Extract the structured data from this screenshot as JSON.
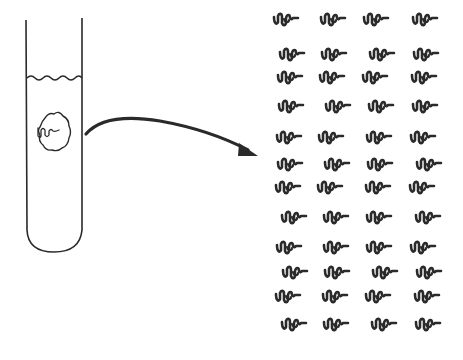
{
  "diagram": {
    "colors": {
      "ink": "#2a2a2a",
      "background": "#ffffff"
    },
    "test_tube": {
      "x_left": 26,
      "x_right": 82,
      "top": 20,
      "liquid_level": 78,
      "bottom": 250
    },
    "cell": {
      "cx": 54,
      "cy": 143,
      "label": "cell-with-dna"
    },
    "arrow": {
      "from": [
        86,
        133
      ],
      "to": [
        255,
        155
      ]
    },
    "copies": {
      "rows": 12,
      "cols": 4,
      "col_x": [
        288,
        332,
        377,
        423
      ],
      "row_y": [
        20,
        55,
        78,
        107,
        138,
        165,
        188,
        218,
        248,
        273,
        297,
        325
      ],
      "row_offsets": [
        0,
        4,
        0,
        4,
        0,
        4,
        0,
        4,
        2,
        6,
        2,
        6
      ]
    }
  }
}
